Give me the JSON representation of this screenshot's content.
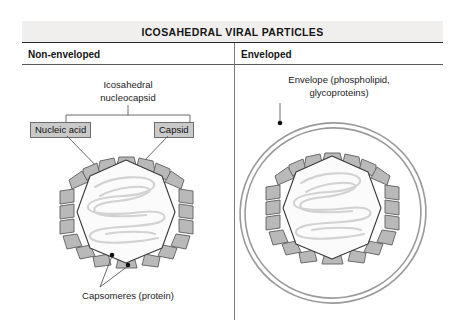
{
  "figure": {
    "title": "ICOSAHEDRAL VIRAL PARTICLES",
    "columns": [
      {
        "header": "Non-enveloped"
      },
      {
        "header": "Enveloped"
      }
    ],
    "left_panel": {
      "top_label_line1": "Icosahedral",
      "top_label_line2": "nucleocapsid",
      "box_nucleic_acid": "Nucleic acid",
      "box_capsid": "Capsid",
      "bottom_label": "Capsomeres (protein)"
    },
    "right_panel": {
      "top_label_line1": "Envelope (phospholipid,",
      "top_label_line2": "glycoproteins)"
    },
    "colors": {
      "header_band": "#f1efee",
      "header_rule": "#2b2b2b",
      "divider": "#7d7d7d",
      "capsomere_fill": "#b9b9b9",
      "capsomere_stroke": "#5d5d5d",
      "capsid_fill": "#fbfbfb",
      "capsid_stroke": "#3a3a3a",
      "nucleic_acid_stroke": "#cfcfcf",
      "envelope_stroke": "#9a9a9a",
      "label_box_fill": "#c9c9c9",
      "label_box_stroke": "#6e6e6e",
      "leader_line": "#5a5a5a",
      "text": "#1b1b1b"
    }
  }
}
